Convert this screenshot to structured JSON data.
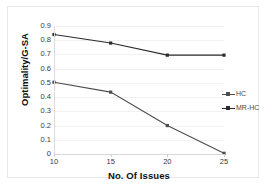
{
  "chart_data": {
    "type": "line",
    "title": "",
    "xlabel": "No. Of Issues",
    "ylabel": "Optimality/G-SA",
    "x": [
      10,
      15,
      20,
      25
    ],
    "xticklabels": [
      "10",
      "15",
      "20",
      "25"
    ],
    "yticklabels": [
      "0.9",
      "0.8",
      "0.7",
      "0.6",
      "0.5",
      "0.4",
      "0.3",
      "0.2",
      "0.1",
      "0"
    ],
    "ytickvalues": [
      0.9,
      0.8,
      0.7,
      0.6,
      0.5,
      0.4,
      0.3,
      0.2,
      0.1,
      0
    ],
    "xlim": [
      10,
      25
    ],
    "ylim": [
      0,
      0.9
    ],
    "grid": true,
    "legend_position": "right",
    "series": [
      {
        "name": "HC",
        "color": "#4d4d4d",
        "values": [
          0.505,
          0.435,
          0.2,
          0.005
        ]
      },
      {
        "name": "MR-HC",
        "color": "#2b2b2b",
        "values": [
          0.84,
          0.78,
          0.695,
          0.695
        ]
      }
    ]
  },
  "legend": {
    "entries": [
      {
        "label": "HC"
      },
      {
        "label": "MR-HC"
      }
    ]
  },
  "axes": {
    "x_title": "No. Of Issues",
    "y_title": "Optimality/G-SA"
  }
}
